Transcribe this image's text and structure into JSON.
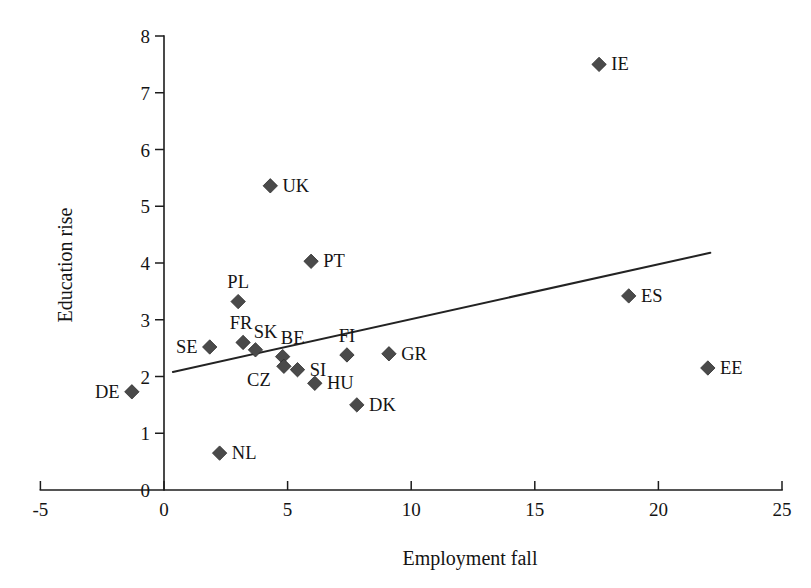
{
  "chart_data": {
    "type": "scatter",
    "title": "",
    "xlabel": "Employment fall",
    "ylabel": "Education rise",
    "xlim": [
      -5,
      25
    ],
    "ylim": [
      0,
      8
    ],
    "xticks": [
      "-5",
      "0",
      "5",
      "10",
      "15",
      "20",
      "25"
    ],
    "xtick_values": [
      -5,
      0,
      5,
      10,
      15,
      20,
      25
    ],
    "yticks": [
      "0",
      "1",
      "2",
      "3",
      "4",
      "5",
      "6",
      "7",
      "8"
    ],
    "ytick_values": [
      0,
      1,
      2,
      3,
      4,
      5,
      6,
      7,
      8
    ],
    "grid": false,
    "legend": "none",
    "marker_shape": "diamond",
    "marker_color": "#4a4a4a",
    "trendline": {
      "type": "linear",
      "color": "#232323",
      "x_start": 0.36,
      "y_start": 2.08,
      "x_end": 22.1,
      "y_end": 4.18
    },
    "points": [
      {
        "label": "DE",
        "x": -1.3,
        "y": 1.73,
        "label_pos": "left"
      },
      {
        "label": "SE",
        "x": 1.85,
        "y": 2.52,
        "label_pos": "left"
      },
      {
        "label": "NL",
        "x": 2.25,
        "y": 0.65,
        "label_pos": "right"
      },
      {
        "label": "PL",
        "x": 3.0,
        "y": 3.32,
        "label_pos": "above"
      },
      {
        "label": "FR",
        "x": 3.2,
        "y": 2.6,
        "label_pos": "above-left"
      },
      {
        "label": "SK",
        "x": 3.7,
        "y": 2.47,
        "label_pos": "above-right"
      },
      {
        "label": "UK",
        "x": 4.3,
        "y": 5.36,
        "label_pos": "right"
      },
      {
        "label": "BE",
        "x": 4.8,
        "y": 2.35,
        "label_pos": "above-right"
      },
      {
        "label": "CZ",
        "x": 4.85,
        "y": 2.18,
        "label_pos": "below-left"
      },
      {
        "label": "SI",
        "x": 5.4,
        "y": 2.12,
        "label_pos": "right"
      },
      {
        "label": "PT",
        "x": 5.95,
        "y": 4.03,
        "label_pos": "right"
      },
      {
        "label": "HU",
        "x": 6.1,
        "y": 1.88,
        "label_pos": "right"
      },
      {
        "label": "FI",
        "x": 7.4,
        "y": 2.38,
        "label_pos": "above"
      },
      {
        "label": "DK",
        "x": 7.8,
        "y": 1.5,
        "label_pos": "right"
      },
      {
        "label": "GR",
        "x": 9.1,
        "y": 2.4,
        "label_pos": "right"
      },
      {
        "label": "IE",
        "x": 17.6,
        "y": 7.5,
        "label_pos": "right"
      },
      {
        "label": "ES",
        "x": 18.8,
        "y": 3.42,
        "label_pos": "right"
      },
      {
        "label": "EE",
        "x": 22.0,
        "y": 2.15,
        "label_pos": "right"
      }
    ]
  }
}
